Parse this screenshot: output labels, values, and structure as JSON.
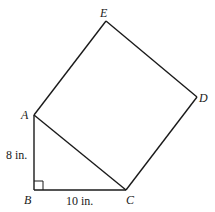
{
  "figure": {
    "type": "geometry",
    "vertices": {
      "A": {
        "label": "A",
        "x": 34,
        "y": 115
      },
      "B": {
        "label": "B",
        "x": 34,
        "y": 190
      },
      "C": {
        "label": "C",
        "x": 126,
        "y": 190
      },
      "D": {
        "label": "D",
        "x": 197,
        "y": 97
      },
      "E": {
        "label": "E",
        "x": 106,
        "y": 21
      }
    },
    "measurements": {
      "AB": "8 in.",
      "BC": "10 in."
    },
    "right_angle_at": "B",
    "stroke_color": "#1a1a1a"
  }
}
